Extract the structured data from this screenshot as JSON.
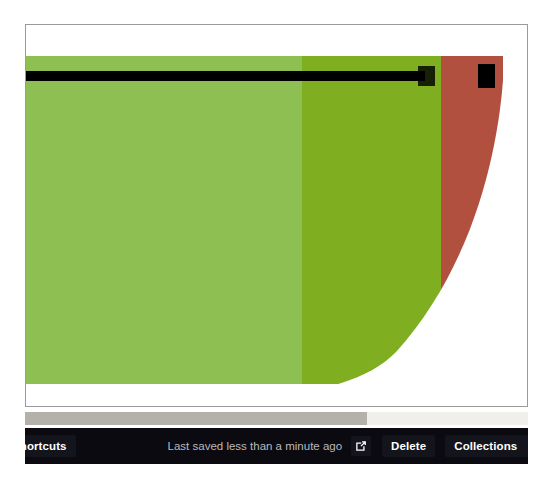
{
  "chart_data": {
    "type": "bar",
    "subtype": "bullet-graph",
    "title": "",
    "xlabel": "",
    "ylabel": "",
    "zoom_note": "Chart is displayed at extreme magnification; only a fragment of the bullet graph is visible.",
    "categories": [
      ""
    ],
    "axis_range": [
      0,
      100
    ],
    "qualitative_ranges": [
      {
        "name": "good",
        "from": 0,
        "to": 38,
        "color": "#8dbf52"
      },
      {
        "name": "satisfactory",
        "from": 38,
        "to": 77,
        "color": "#7fae20"
      },
      {
        "name": "poor",
        "from": 77,
        "to": 100,
        "color": "#b1503f"
      }
    ],
    "measure": {
      "name": "actual",
      "value": 72,
      "color": "#000000"
    },
    "target": {
      "name": "target",
      "value": 100,
      "color": "#000000"
    },
    "grid": false,
    "legend": "none"
  },
  "canvas": {
    "background_color": "#ffffff",
    "border_color": "#9a9a9a"
  },
  "scrollbar": {
    "orientation": "horizontal",
    "track_color": "#f0efeb",
    "thumb_color": "#b4b1ab",
    "thumb_fraction_percent": 68
  },
  "toolbar": {
    "background_color": "#0a0a10",
    "shortcuts_label": "Shortcuts",
    "saved_status": "Last saved less than a minute ago",
    "open_external_icon": "external-link-icon",
    "delete_label": "Delete",
    "collections_label": "Collections",
    "collections_caret_icon": "chevron-down-icon",
    "export_label": "E"
  }
}
